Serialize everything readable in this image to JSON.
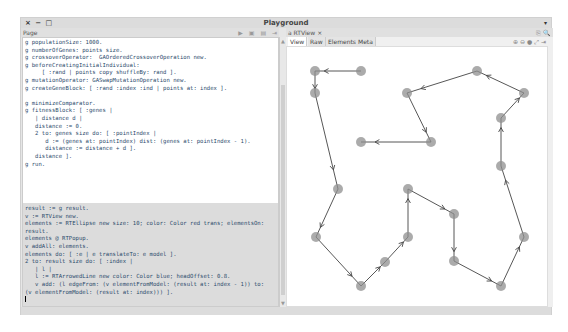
{
  "window": {
    "title": "Playground",
    "controls": "× − □",
    "menu_arrow": "▾"
  },
  "left_pane": {
    "header_label": "Page",
    "toolbar_icons": [
      "play-icon",
      "save-icon",
      "list-icon",
      "pin-icon"
    ],
    "toolbar_glyphs": "▶ ▣ ▤ ⇥",
    "code_block_1": "g populationSize: 1000.\ng numberOfGenes: points size.\ng crossoverOperator:  GAOrderedCrossoverOperation new.\ng beforeCreatingInitialIndividual:\n     [ :rand | points copy shuffleBy: rand ].\ng mutationOperator: GASwapMutationOperation new.\ng createGeneBlock: [ :rand :index :ind | points at: index ].\n\ng minimizeComparator.\ng fitnessBlock: [ :genes |\n   | distance d |\n   distance := 0.\n   2 to: genes size do: [ :pointIndex |\n      d := (genes at: pointIndex) dist: (genes at: pointIndex - 1).\n      distance := distance + d ].\n   distance ].\ng run.",
    "code_block_2": "result := g result.\nv := RTView new.\nelements := RTEllipse new size: 10; color: Color red trans; elementsOn:\nresult.\nelements @ RTPopup.\nv addAll: elements.\nelements do: [ :e | e translateTo: e model ].\n2 to: result size do: [ :index |\n   | l |\n   l := RTArrowedLine new color: Color blue; headOffset: 0.8.\n   v add: (l edgeFrom: (v elementFromModel: (result at: index - 1)) to:\n(v elementFromModel: (result at: index))) ].",
    "cursor_line": "v"
  },
  "right_pane": {
    "tab_label": "a RTView",
    "tab_close": "×",
    "header_icons": "⎘ 🔍",
    "subtabs": [
      "View",
      "Raw",
      "Elements",
      "Meta"
    ],
    "zoom_tools": "⊕ ⊖ ● ⤢ ⇥"
  },
  "graph": {
    "node_color": "#8f8f8f",
    "edge_color": "#444444",
    "nodes": [
      [
        361,
        71
      ],
      [
        315,
        71
      ],
      [
        315,
        93
      ],
      [
        338,
        189
      ],
      [
        316,
        237
      ],
      [
        361,
        286
      ],
      [
        385,
        262
      ],
      [
        408,
        237
      ],
      [
        408,
        189
      ],
      [
        454,
        214
      ],
      [
        454,
        261
      ],
      [
        501,
        286
      ],
      [
        524,
        237
      ],
      [
        501,
        166
      ],
      [
        501,
        118
      ],
      [
        524,
        93
      ],
      [
        477,
        71
      ],
      [
        407,
        93
      ],
      [
        431,
        142
      ],
      [
        361,
        142
      ]
    ]
  }
}
